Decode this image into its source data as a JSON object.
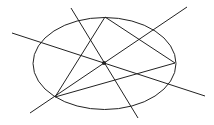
{
  "diagram": {
    "stroke_color": "#222222",
    "background": "#ffffff",
    "ellipse": {
      "cx": 104.5,
      "cy": 63.5,
      "rx": 71.5,
      "ry": 46
    },
    "points": {
      "top": {
        "x": 105,
        "y": 17
      },
      "right": {
        "x": 175,
        "y": 63
      },
      "bottom_left": {
        "x": 55,
        "y": 97
      },
      "center": {
        "x": 104,
        "y": 63
      }
    },
    "segments": [
      {
        "name": "triangle-side-top-right",
        "x1": 105,
        "y1": 17,
        "x2": 175,
        "y2": 63
      },
      {
        "name": "triangle-side-top-bottomleft",
        "x1": 105,
        "y1": 17,
        "x2": 55,
        "y2": 97
      },
      {
        "name": "triangle-side-right-bottomleft",
        "x1": 175,
        "y1": 63,
        "x2": 55,
        "y2": 97
      }
    ],
    "lines": [
      {
        "name": "line-through-center-shallow",
        "x1": 12,
        "y1": 33,
        "x2": 205,
        "y2": 96
      },
      {
        "name": "line-through-center-steep",
        "x1": 71,
        "y1": 8,
        "x2": 138,
        "y2": 118
      },
      {
        "name": "line-through-center-diagonal",
        "x1": 30,
        "y1": 113,
        "x2": 187,
        "y2": 7
      }
    ],
    "center_dot_radius": 2
  }
}
